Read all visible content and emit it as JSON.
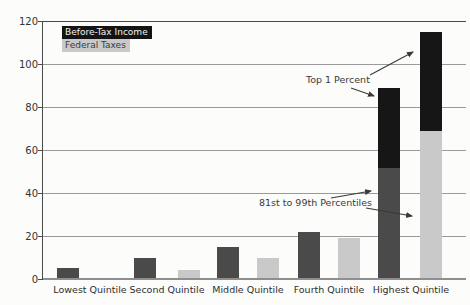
{
  "figure": {
    "background": "#fcfcfa"
  },
  "legend": {
    "items": [
      {
        "label": "Before-Tax Income",
        "bg": "#141414",
        "text_color": "#f2f2ee"
      },
      {
        "label": "Federal Taxes",
        "bg": "#c9c9c9",
        "text_color": "#3a3a3a"
      }
    ]
  },
  "chart_data": {
    "type": "bar",
    "categories": [
      "Lowest Quintile",
      "Second Quintile",
      "Middle Quintile",
      "Fourth Quintile",
      "Highest Quintile"
    ],
    "series": [
      {
        "name": "Before-Tax Income",
        "color": "#4a4a4a",
        "values": [
          5,
          10,
          15,
          22,
          89
        ],
        "highest_quintile_split": {
          "p81_99": 51.5,
          "top1": 37.5
        }
      },
      {
        "name": "Federal Taxes",
        "color": "#c9c9c9",
        "values": [
          0,
          4,
          10,
          19,
          115
        ],
        "highest_quintile_split": {
          "p81_99": 69,
          "top1": 46
        }
      }
    ],
    "top1_segment_color": "#161616",
    "title": "",
    "xlabel": "",
    "ylabel": "",
    "ylim": [
      0,
      120
    ],
    "yticks": [
      0,
      20,
      40,
      60,
      80,
      100,
      120
    ],
    "grid": true,
    "legend_position": "top-left",
    "annotations": [
      {
        "text": "Top 1 Percent",
        "points_to": "black top segments of both Highest Quintile bars"
      },
      {
        "text": "81st to 99th Percentiles",
        "points_to": "gray lower segments of both Highest Quintile bars"
      }
    ]
  }
}
